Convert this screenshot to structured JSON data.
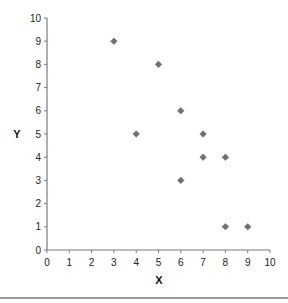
{
  "chart_data": {
    "type": "scatter",
    "title": "",
    "xlabel": "X",
    "ylabel": "Y",
    "xlim": [
      0,
      10
    ],
    "ylim": [
      0,
      10
    ],
    "x_ticks": [
      "0",
      "1",
      "2",
      "3",
      "4",
      "5",
      "6",
      "7",
      "8",
      "9",
      "10"
    ],
    "y_ticks": [
      "0",
      "1",
      "2",
      "3",
      "4",
      "5",
      "6",
      "7",
      "8",
      "9",
      "10"
    ],
    "grid": false,
    "legend": null,
    "series": [
      {
        "name": "data",
        "marker": "diamond",
        "color": "#707070",
        "points": [
          {
            "x": 3,
            "y": 9
          },
          {
            "x": 5,
            "y": 8
          },
          {
            "x": 6,
            "y": 6
          },
          {
            "x": 4,
            "y": 5
          },
          {
            "x": 7,
            "y": 5
          },
          {
            "x": 7,
            "y": 4
          },
          {
            "x": 8,
            "y": 4
          },
          {
            "x": 6,
            "y": 3
          },
          {
            "x": 8,
            "y": 1
          },
          {
            "x": 9,
            "y": 1
          }
        ]
      }
    ]
  },
  "colors": {
    "axis": "#7a7a7a",
    "marker": "#707070",
    "rule": "#9a9a9a"
  }
}
